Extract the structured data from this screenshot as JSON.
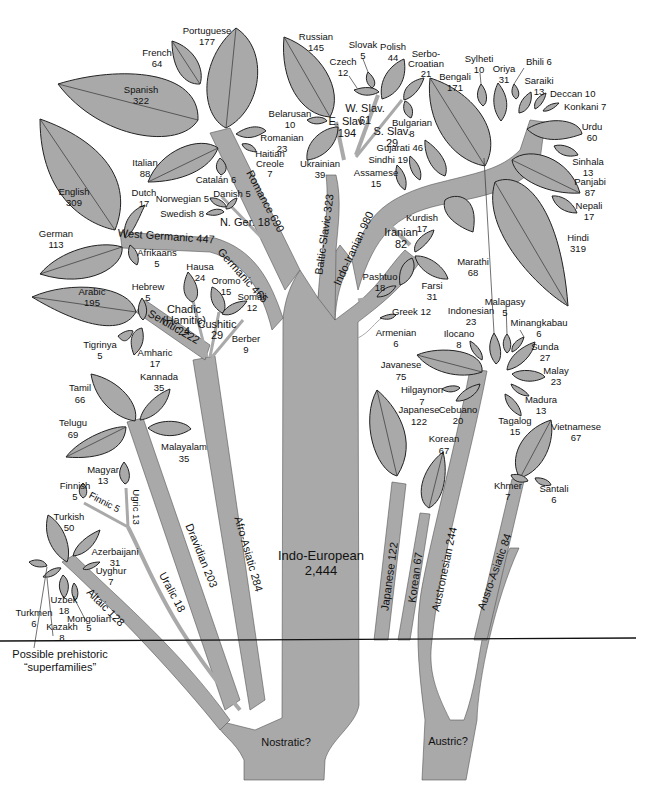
{
  "colors": {
    "branch": "#a9a9a9",
    "leaf": "#a9a9a9",
    "outline": "#222222",
    "divider": "#111111",
    "background": "#ffffff"
  },
  "divider": {
    "caption_line1": "Possible prehistoric",
    "caption_line2": "“superfamilies”"
  },
  "superfamilies": {
    "nostratic": "Nostratic?",
    "austric": "Austric?"
  },
  "branches": {
    "indo_european": {
      "name": "Indo-European",
      "value": "2,444"
    },
    "afro_asiatic": "Afro-Asiatic 284",
    "dravidian": "Dravidian 203",
    "uralic": "Uralic 18",
    "altaic": "Altaic 128",
    "finnic": "Finnic 5",
    "ugric": "Ugric 13",
    "semitic": "Semitic 222",
    "chadic": [
      "Chadic",
      "(Hamitic)",
      "24"
    ],
    "cushitic": [
      "Cushitic",
      "29"
    ],
    "germanic": "Germanic 465",
    "west_germanic": "West Germanic 447",
    "north_germanic": "N. Ger. 18",
    "romance": "Romance 690",
    "baltic_slavic": "Baltic-Slavic 323",
    "w_slav": [
      "W. Slav.",
      "61"
    ],
    "e_slav": [
      "E. Slav.",
      "194"
    ],
    "s_slav": [
      "S. Slav.",
      "29"
    ],
    "indo_iranian": "Indo-Iranian 980",
    "iranian": [
      "Iranian",
      "82"
    ],
    "japanese": "Japanese 122",
    "korean": "Korean 67",
    "austronesian": "Austronesian 244",
    "austro_asiatic": "Ausro-Asiatic 84"
  },
  "languages": {
    "portuguese": [
      "Portuguese",
      "177"
    ],
    "french": [
      "French",
      "64"
    ],
    "spanish": [
      "Spanish",
      "322"
    ],
    "italian": [
      "Italian",
      "88"
    ],
    "catalan": "Catalán 6",
    "romanian": [
      "Romanian",
      "23"
    ],
    "haitian": [
      "Haitian",
      "Creole",
      "7"
    ],
    "english": [
      "English",
      "309"
    ],
    "dutch": [
      "Dutch",
      "17"
    ],
    "german": [
      "German",
      "113"
    ],
    "afrikaans": [
      "Afrikaans",
      "5"
    ],
    "norwegian": "Norwegian 5",
    "danish": "Danish 5",
    "swedish": "Swedish 8",
    "russian": [
      "Russian",
      "145"
    ],
    "slovak": [
      "Slovak",
      "5"
    ],
    "czech": [
      "Czech",
      "12"
    ],
    "polish": [
      "Polish",
      "44"
    ],
    "serbo_croatian": [
      "Serbo-",
      "Croatian",
      "21"
    ],
    "belarusan": [
      "Belarusan",
      "10"
    ],
    "ukrainian": [
      "Ukrainian",
      "39"
    ],
    "bulgarian": [
      "Bulgarian",
      "8"
    ],
    "bengali": [
      "Bengali",
      "171"
    ],
    "sylheti": [
      "Sylheti",
      "10"
    ],
    "oriya": [
      "Oriya",
      "31"
    ],
    "bhili": "Bhili 6",
    "saraiki": [
      "Saraiki",
      "13"
    ],
    "deccan": "Deccan 10",
    "konkani": "Konkani 7",
    "urdu": [
      "Urdu",
      "60"
    ],
    "sinhala": [
      "Sinhala",
      "13"
    ],
    "panjabi": [
      "Panjabi",
      "87"
    ],
    "nepali": [
      "Nepali",
      "17"
    ],
    "hindi": [
      "Hindi",
      "319"
    ],
    "marathi": [
      "Marathi",
      "68"
    ],
    "gujarati": "Gujarati 46",
    "sindhi": "Sindhi 19",
    "assamese": [
      "Assamese",
      "15"
    ],
    "kurdish": [
      "Kurdish",
      "17"
    ],
    "pashtuo": [
      "Pashtuo",
      "18"
    ],
    "farsi": [
      "Farsi",
      "31"
    ],
    "greek": "Greek 12",
    "armenian": [
      "Armenian",
      "6"
    ],
    "arabic": [
      "Arabic",
      "195"
    ],
    "hebrew": [
      "Hebrew",
      "5"
    ],
    "tigrinya": [
      "Tigrinya",
      "5"
    ],
    "amharic": [
      "Amharic",
      "17"
    ],
    "hausa": [
      "Hausa",
      "24"
    ],
    "oromo": [
      "Oromo",
      "15"
    ],
    "somali": [
      "Somali",
      "12"
    ],
    "berber": [
      "Berber",
      "9"
    ],
    "tamil": [
      "Tamil",
      "66"
    ],
    "kannada": [
      "Kannada",
      "35"
    ],
    "telugu": [
      "Telugu",
      "69"
    ],
    "malayalam": [
      "Malayalam",
      "35"
    ],
    "magyar": [
      "Magyar",
      "13"
    ],
    "finnish": [
      "Finnish",
      "5"
    ],
    "turkish": [
      "Turkish",
      "50"
    ],
    "azerbaijani": [
      "Azerbaijani",
      "31"
    ],
    "uyghur": [
      "Uyghur",
      "7"
    ],
    "uzbek": [
      "Uzbek",
      "18"
    ],
    "turkmen": [
      "Turkmen",
      "6"
    ],
    "kazakh": [
      "Kazakh",
      "8"
    ],
    "mongolian": [
      "Mongolian",
      "5"
    ],
    "indonesian": [
      "Indonesian",
      "23"
    ],
    "malagasy": [
      "Malagasy",
      "5"
    ],
    "minangkabau": [
      "Minangkabau",
      "6"
    ],
    "ilocano": [
      "Ilocano",
      "8"
    ],
    "sunda": [
      "Sunda",
      "27"
    ],
    "javanese": [
      "Javanese",
      "75"
    ],
    "malay": [
      "Malay",
      "23"
    ],
    "hilgaynon": [
      "Hilgaynon",
      "7"
    ],
    "madura": [
      "Madura",
      "13"
    ],
    "cebuano": [
      "Cebuano",
      "20"
    ],
    "tagalog": [
      "Tagalog",
      "15"
    ],
    "japanese": [
      "Japanese",
      "122"
    ],
    "korean": [
      "Korean",
      "67"
    ],
    "vietnamese": [
      "Vietnamese",
      "67"
    ],
    "khmer": [
      "Khmer",
      "7"
    ],
    "santali": [
      "Santali",
      "6"
    ]
  }
}
